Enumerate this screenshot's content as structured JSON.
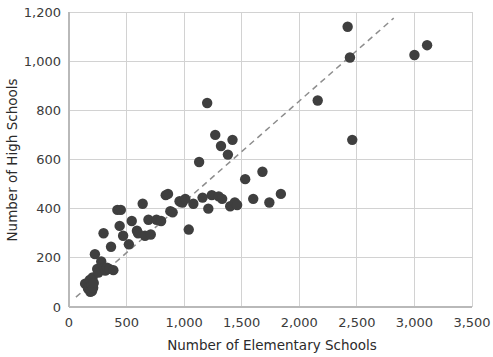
{
  "chart_data": {
    "type": "scatter",
    "title": "",
    "xlabel": "Number of Elementary Schools",
    "ylabel": "Number of High Schools",
    "xlim": [
      0,
      3500
    ],
    "ylim": [
      0,
      1200
    ],
    "xticks": [
      0,
      500,
      1000,
      1500,
      2000,
      2500,
      3000,
      3500
    ],
    "xtick_labels": [
      "0",
      "500",
      "1,000",
      "1,500",
      "2,000",
      "2,500",
      "3,000",
      "3,500"
    ],
    "yticks": [
      0,
      200,
      400,
      600,
      800,
      1000,
      1200
    ],
    "ytick_labels": [
      "0",
      "200",
      "400",
      "600",
      "800",
      "1,000",
      "1,200"
    ],
    "grid": true,
    "legend": "none",
    "marker_color": "#3f3f3f",
    "marker_size": 5.2,
    "trendline": {
      "style": "dashed",
      "color": "#8d8d8d",
      "x_start": 60,
      "y_start": 40,
      "x_end": 2820,
      "y_end": 1175
    },
    "points": [
      [
        140,
        95
      ],
      [
        165,
        75
      ],
      [
        175,
        85
      ],
      [
        180,
        110
      ],
      [
        185,
        62
      ],
      [
        190,
        70
      ],
      [
        195,
        90
      ],
      [
        200,
        65
      ],
      [
        205,
        120
      ],
      [
        210,
        78
      ],
      [
        215,
        98
      ],
      [
        225,
        215
      ],
      [
        245,
        155
      ],
      [
        255,
        140
      ],
      [
        280,
        185
      ],
      [
        300,
        300
      ],
      [
        305,
        160
      ],
      [
        315,
        148
      ],
      [
        330,
        160
      ],
      [
        350,
        155
      ],
      [
        365,
        245
      ],
      [
        385,
        150
      ],
      [
        420,
        395
      ],
      [
        440,
        330
      ],
      [
        450,
        395
      ],
      [
        470,
        290
      ],
      [
        520,
        255
      ],
      [
        545,
        350
      ],
      [
        590,
        310
      ],
      [
        600,
        300
      ],
      [
        640,
        420
      ],
      [
        660,
        290
      ],
      [
        690,
        355
      ],
      [
        710,
        295
      ],
      [
        760,
        355
      ],
      [
        800,
        350
      ],
      [
        840,
        455
      ],
      [
        860,
        460
      ],
      [
        880,
        390
      ],
      [
        900,
        385
      ],
      [
        960,
        430
      ],
      [
        985,
        425
      ],
      [
        1010,
        440
      ],
      [
        1040,
        315
      ],
      [
        1080,
        420
      ],
      [
        1130,
        590
      ],
      [
        1160,
        445
      ],
      [
        1200,
        830
      ],
      [
        1210,
        400
      ],
      [
        1240,
        455
      ],
      [
        1270,
        700
      ],
      [
        1300,
        450
      ],
      [
        1320,
        655
      ],
      [
        1330,
        440
      ],
      [
        1380,
        620
      ],
      [
        1400,
        410
      ],
      [
        1420,
        680
      ],
      [
        1440,
        425
      ],
      [
        1460,
        415
      ],
      [
        1530,
        520
      ],
      [
        1600,
        440
      ],
      [
        1680,
        550
      ],
      [
        1740,
        425
      ],
      [
        1840,
        460
      ],
      [
        2160,
        840
      ],
      [
        2420,
        1140
      ],
      [
        2440,
        1015
      ],
      [
        2460,
        680
      ],
      [
        3000,
        1025
      ],
      [
        3110,
        1065
      ]
    ]
  },
  "axes": {
    "x_axis_name": "x-axis",
    "y_axis_name": "y-axis"
  }
}
